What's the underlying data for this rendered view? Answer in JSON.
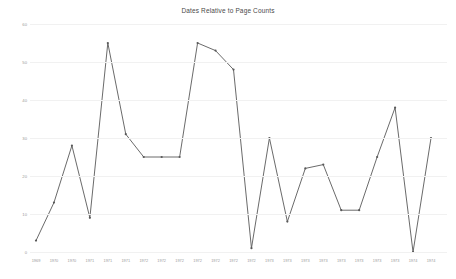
{
  "chart_data": {
    "type": "line",
    "title": "Dates Relative to Page Counts",
    "xlabel": "",
    "ylabel": "",
    "ylim": [
      0,
      60
    ],
    "yticks": [
      0,
      10,
      20,
      30,
      40,
      50,
      60
    ],
    "ytick_labels": [
      "0",
      "10",
      "20",
      "30",
      "40",
      "50",
      "60"
    ],
    "grid": true,
    "legend": false,
    "legend_position": "none",
    "marker": "dot",
    "line_color": "#595959",
    "grid_color": "#f1f1f1",
    "label_color": "#9a9a9a",
    "categories": [
      "1969",
      "1970",
      "1970",
      "1971",
      "1971",
      "1971",
      "1972",
      "1972",
      "1972",
      "1972",
      "1972",
      "1972",
      "1972",
      "1973",
      "1973",
      "1973",
      "1973",
      "1973",
      "1973",
      "1973",
      "1973",
      "1974",
      "1974"
    ],
    "x": [
      "1969",
      "1970",
      "1970",
      "1971",
      "1971",
      "1971",
      "1972",
      "1972",
      "1972",
      "1972",
      "1972",
      "1972",
      "1972",
      "1973",
      "1973",
      "1973",
      "1973",
      "1973",
      "1973",
      "1973",
      "1973",
      "1974",
      "1974"
    ],
    "values": [
      3,
      13,
      28,
      9,
      55,
      31,
      25,
      25,
      25,
      55,
      53,
      48,
      1,
      30,
      8,
      22,
      23,
      11,
      11,
      25,
      38,
      0,
      30
    ],
    "series": [
      {
        "name": "Page Counts",
        "values": [
          3,
          13,
          28,
          9,
          55,
          31,
          25,
          25,
          25,
          55,
          53,
          48,
          1,
          30,
          8,
          22,
          23,
          11,
          11,
          25,
          38,
          0,
          30
        ]
      }
    ]
  }
}
